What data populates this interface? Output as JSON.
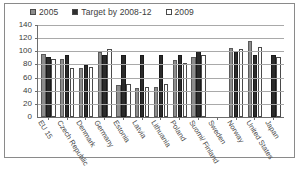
{
  "chart_data": {
    "type": "bar",
    "title": "",
    "subtitle": "",
    "xlabel": "",
    "ylabel": "",
    "ylim": [
      0,
      140
    ],
    "yticks": [
      0,
      20,
      40,
      60,
      80,
      100,
      120,
      140
    ],
    "grid": true,
    "legend_position": "top",
    "categories": [
      "EU 15",
      "Czech Republic",
      "Denmark",
      "Germany",
      "Estonia",
      "Latvia",
      "Lithuania",
      "Poland",
      "Suomi/ Finland",
      "Sweden",
      "Norway",
      "United States",
      "Japan"
    ],
    "series": [
      {
        "name": "2005",
        "color": "#8d8d8d",
        "values": [
          96,
          88,
          74,
          99,
          48,
          44,
          46,
          87,
          92,
          null,
          105,
          115,
          null
        ]
      },
      {
        "name": "Target by 2008-12",
        "color": "#2b2b2b",
        "values": [
          92,
          95,
          79,
          94,
          95,
          95,
          95,
          94,
          100,
          null,
          101,
          94,
          94
        ]
      },
      {
        "name": "2009",
        "color": "#ffffff",
        "values": [
          89,
          74,
          76,
          103,
          50,
          46,
          50,
          82,
          94,
          null,
          104,
          107,
          92
        ]
      }
    ]
  },
  "legend": {
    "items": [
      {
        "label": "2005",
        "swatch": "gray-swatch"
      },
      {
        "label": "Target by 2008-12",
        "swatch": "black-swatch"
      },
      {
        "label": "2009",
        "swatch": "white-swatch"
      }
    ]
  },
  "axis": {
    "y_labels": [
      "140",
      "120",
      "100",
      "80",
      "60",
      "40",
      "20",
      "0"
    ]
  }
}
